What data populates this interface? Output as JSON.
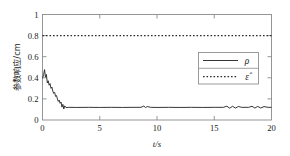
{
  "chart_data": {
    "type": "line",
    "title": "",
    "subtitle": "",
    "xlabel": "t/s",
    "xlabel_symbol": "t",
    "xlabel_unit": "s",
    "ylabel": "参数响应/cm",
    "xlim": [
      0,
      20
    ],
    "ylim": [
      0,
      1
    ],
    "xticks": [
      0,
      5,
      10,
      15,
      20
    ],
    "xtick_labels": [
      "0",
      "5",
      "10",
      "15",
      "20"
    ],
    "yticks": [
      0,
      0.2,
      0.4,
      0.6,
      0.8,
      1
    ],
    "ytick_labels": [
      "0",
      "0.2",
      "0.4",
      "0.6",
      "0.8",
      "1"
    ],
    "grid": false,
    "legend_position": "upper-right",
    "legend_entries": [
      {
        "label": "ρ",
        "style": "solid"
      },
      {
        "label": "ε̂",
        "style": "dotted"
      }
    ],
    "series": [
      {
        "name": "ρ",
        "style": "solid",
        "color": "#2b2b2b",
        "x": [
          0.0,
          0.1,
          0.18,
          0.26,
          0.34,
          0.42,
          0.5,
          0.58,
          0.66,
          0.74,
          0.82,
          0.9,
          0.98,
          1.06,
          1.14,
          1.22,
          1.3,
          1.38,
          1.46,
          1.54,
          1.62,
          1.7,
          1.78,
          1.86,
          1.94,
          2.05,
          2.3,
          3.0,
          4.0,
          5.0,
          6.0,
          7.0,
          8.0,
          8.6,
          8.85,
          9.0,
          9.15,
          9.45,
          10.0,
          11.0,
          12.0,
          13.0,
          14.0,
          15.0,
          15.8,
          16.1,
          16.35,
          16.6,
          16.85,
          17.1,
          17.4,
          18.0,
          18.3,
          18.55,
          18.8,
          19.05,
          19.35,
          19.7,
          20.0
        ],
        "y": [
          0.395,
          0.432,
          0.478,
          0.406,
          0.432,
          0.352,
          0.372,
          0.33,
          0.345,
          0.3,
          0.312,
          0.274,
          0.252,
          0.262,
          0.224,
          0.232,
          0.2,
          0.176,
          0.188,
          0.158,
          0.17,
          0.122,
          0.148,
          0.104,
          0.134,
          0.118,
          0.12,
          0.119,
          0.12,
          0.119,
          0.12,
          0.119,
          0.12,
          0.12,
          0.132,
          0.118,
          0.128,
          0.12,
          0.119,
          0.12,
          0.119,
          0.12,
          0.119,
          0.12,
          0.12,
          0.131,
          0.112,
          0.13,
          0.113,
          0.128,
          0.12,
          0.12,
          0.13,
          0.113,
          0.129,
          0.114,
          0.127,
          0.12,
          0.12
        ]
      },
      {
        "name": "ε̂",
        "style": "dotted",
        "color": "#2b2b2b",
        "x": [
          0,
          20
        ],
        "y": [
          0.8,
          0.8
        ]
      }
    ],
    "annotations": []
  }
}
